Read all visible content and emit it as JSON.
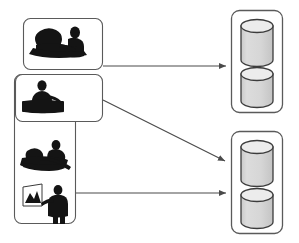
{
  "diagram": {
    "type": "flow-diagram",
    "title": "",
    "background_color": "#ffffff",
    "stroke_color": "#4a4a4a",
    "icon_color": "#141414",
    "cylinder_body_color": "#d4d4d4",
    "cylinder_top_color": "#eaeaea",
    "cylinder_outline_color": "#3c3c3c",
    "groups": [
      {
        "id": "group-meeting",
        "name": "meeting-group-box",
        "shape": "rounded-rectangle",
        "x": 23,
        "y": 18,
        "width": 80,
        "height": 52,
        "icons": [
          {
            "name": "people-meeting-icon",
            "label": "two people meeting at table"
          }
        ]
      },
      {
        "id": "group-workers",
        "name": "workers-group-box",
        "shape": "rounded-rectangle",
        "x": 14,
        "y": 74,
        "width": 62,
        "height": 150,
        "icons": [
          {
            "name": "person-at-desk-icon",
            "label": "person seated at desk"
          },
          {
            "name": "people-reclining-icon",
            "label": "two people working on floor"
          },
          {
            "name": "presenter-chart-icon",
            "label": "presenter pointing at chart easel"
          }
        ]
      },
      {
        "id": "group-desk-inner",
        "name": "desk-inner-box",
        "shape": "rounded-rectangle",
        "x": 15,
        "y": 74,
        "width": 88,
        "height": 48,
        "icons": [
          {
            "name": "person-at-desk-icon",
            "label": "person seated at desk"
          }
        ]
      }
    ],
    "stores": [
      {
        "id": "store-top",
        "name": "database-store-top",
        "shape": "rounded-rectangle",
        "x": 231,
        "y": 10,
        "width": 52,
        "height": 103,
        "cylinders": [
          {
            "name": "database-cylinder",
            "label": "database"
          },
          {
            "name": "database-cylinder",
            "label": "database"
          }
        ]
      },
      {
        "id": "store-bottom",
        "name": "database-store-bottom",
        "shape": "rounded-rectangle",
        "x": 231,
        "y": 131,
        "width": 52,
        "height": 103,
        "cylinders": [
          {
            "name": "database-cylinder",
            "label": "database"
          },
          {
            "name": "database-cylinder",
            "label": "database"
          }
        ]
      }
    ],
    "arrows": [
      {
        "id": "arrow-meeting-to-top-store",
        "name": "arrow-meeting-to-top-store",
        "from": "group-meeting",
        "to": "store-top",
        "style": "straight",
        "path": "M 103 66 L 229 66"
      },
      {
        "id": "arrow-desk-to-bottom-store",
        "name": "arrow-desk-to-bottom-store",
        "from": "group-desk-inner",
        "to": "store-bottom",
        "style": "diagonal",
        "path": "M 103 100 L 229 163"
      },
      {
        "id": "arrow-workers-to-bottom-store",
        "name": "arrow-workers-to-bottom-store",
        "from": "group-workers",
        "to": "store-bottom",
        "style": "straight",
        "path": "M 76 193 L 229 193"
      }
    ]
  }
}
